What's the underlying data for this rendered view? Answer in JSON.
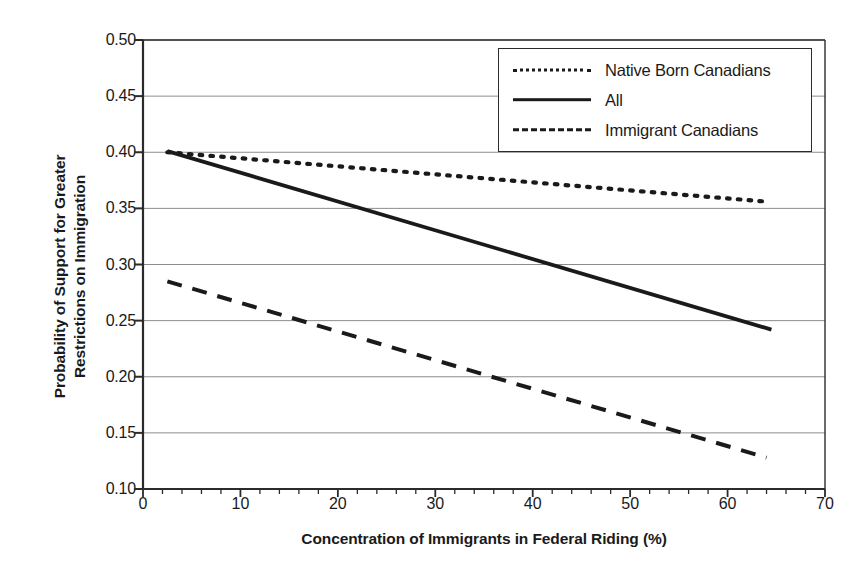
{
  "chart_data": {
    "type": "line",
    "title": "",
    "xlabel": "Concentration of Immigrants in Federal Riding (%)",
    "ylabel_line1": "Probability of Support for Greater",
    "ylabel_line2": "Restrictions on Immigration",
    "xlim": [
      0,
      70
    ],
    "ylim": [
      0.1,
      0.5
    ],
    "xticks": [
      0,
      10,
      20,
      30,
      40,
      50,
      60,
      70
    ],
    "xtick_labels": [
      "0",
      "10",
      "20",
      "30",
      "40",
      "50",
      "60",
      "70"
    ],
    "x_minor_tick_step": 2,
    "yticks": [
      0.1,
      0.15,
      0.2,
      0.25,
      0.3,
      0.35,
      0.4,
      0.45,
      0.5
    ],
    "ytick_labels": [
      "0.10",
      "0.15",
      "0.20",
      "0.25",
      "0.30",
      "0.35",
      "0.40",
      "0.45",
      "0.50"
    ],
    "grid": "horizontal",
    "grid_color": "#8c8c8c",
    "axis_color": "#2b2b2b",
    "line_color": "#1a1a1a",
    "legend_position": "top-right",
    "series": [
      {
        "name": "Native Born Canadians",
        "style": "dotted",
        "x": [
          2.5,
          64.0
        ],
        "y": [
          0.4,
          0.356
        ]
      },
      {
        "name": "All",
        "style": "solid",
        "x": [
          2.5,
          64.5
        ],
        "y": [
          0.401,
          0.242
        ]
      },
      {
        "name": "Immigrant Canadians",
        "style": "dashed",
        "x": [
          2.5,
          64.0
        ],
        "y": [
          0.285,
          0.128
        ]
      }
    ]
  },
  "legend": {
    "items": [
      {
        "label": "Native Born Canadians",
        "style": "dotted"
      },
      {
        "label": "All",
        "style": "solid"
      },
      {
        "label": "Immigrant Canadians",
        "style": "dashed"
      }
    ]
  }
}
